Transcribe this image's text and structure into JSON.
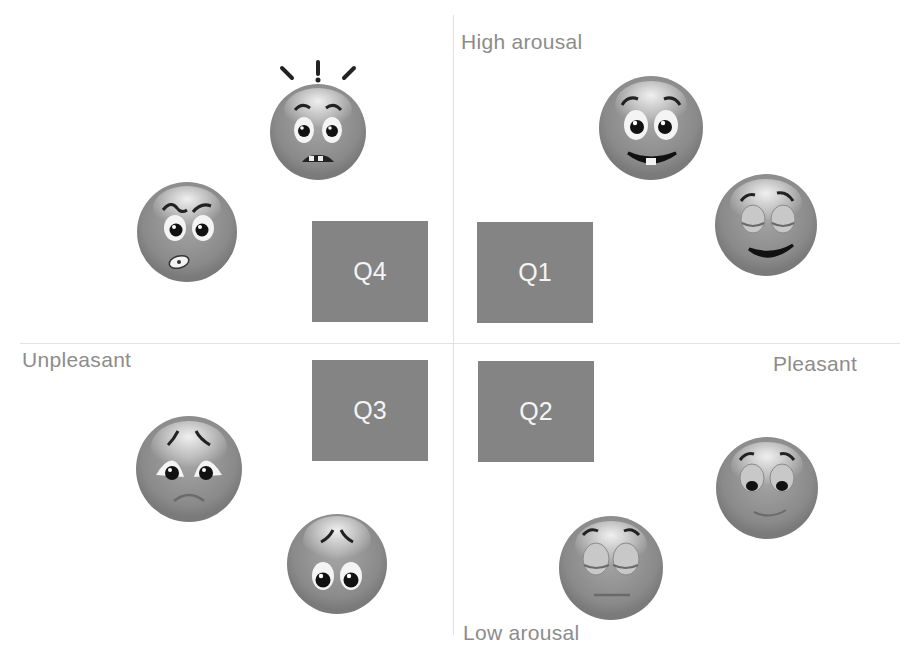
{
  "diagram": {
    "type": "affect-grid",
    "axes": {
      "vertical_top": "High arousal",
      "vertical_bottom": "Low arousal",
      "horizontal_left": "Unpleasant",
      "horizontal_right": "Pleasant"
    },
    "quadrants": [
      {
        "id": "Q4",
        "label": "Q4",
        "position": "top-left"
      },
      {
        "id": "Q1",
        "label": "Q1",
        "position": "top-right"
      },
      {
        "id": "Q3",
        "label": "Q3",
        "position": "bottom-left"
      },
      {
        "id": "Q2",
        "label": "Q2",
        "position": "bottom-right"
      }
    ],
    "faces": [
      {
        "name": "shocked-face",
        "quadrant": "Q4"
      },
      {
        "name": "angry-face",
        "quadrant": "Q4"
      },
      {
        "name": "excited-face",
        "quadrant": "Q1"
      },
      {
        "name": "happy-face",
        "quadrant": "Q1"
      },
      {
        "name": "sad-face",
        "quadrant": "Q3"
      },
      {
        "name": "worried-face",
        "quadrant": "Q3"
      },
      {
        "name": "content-face",
        "quadrant": "Q2"
      },
      {
        "name": "relaxed-face",
        "quadrant": "Q2"
      }
    ],
    "colors": {
      "quadrant_fill": "#848484",
      "quadrant_text": "#f4f4f4",
      "label_text": "#8c8c8c",
      "axis_line": "#e2e2e2",
      "face_fill": "#8e8e8e"
    }
  }
}
